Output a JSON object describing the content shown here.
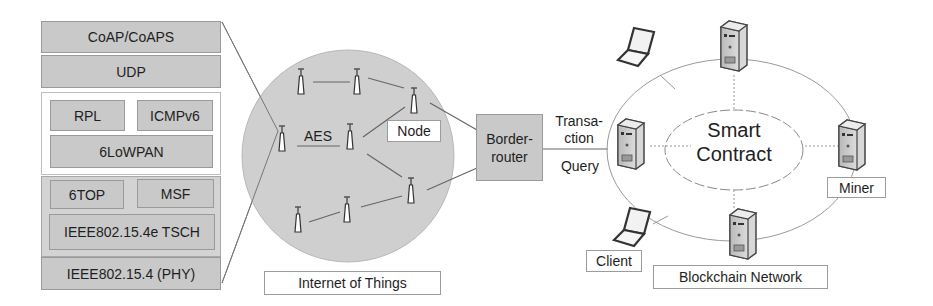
{
  "protocol_stack": {
    "coap": "CoAP/CoAPS",
    "udp": "UDP",
    "rpl": "RPL",
    "icmpv6": "ICMPv6",
    "sixlowpan": "6LoWPAN",
    "sixtop": "6TOP",
    "msf": "MSF",
    "tsch": "IEEE802.15.4e TSCH",
    "phy": "IEEE802.15.4 (PHY)"
  },
  "iot": {
    "aes_label": "AES",
    "node_label": "Node",
    "caption": "Internet of Things",
    "node_icon": "antenna-tower-icon"
  },
  "border_router": {
    "label_line1": "Border-",
    "label_line2": "router"
  },
  "link": {
    "transaction_line1": "Transa-",
    "transaction_line2": "ction",
    "query": "Query"
  },
  "blockchain": {
    "smart_contract_line1": "Smart",
    "smart_contract_line2": "Contract",
    "miner_label": "Miner",
    "client_label": "Client",
    "caption": "Blockchain Network",
    "server_icon": "server-icon",
    "laptop_icon": "laptop-icon"
  },
  "colors": {
    "layer_fill": "#c9c9c9",
    "circle_fill": "#cfcfcf",
    "line": "#8a8a8a"
  }
}
